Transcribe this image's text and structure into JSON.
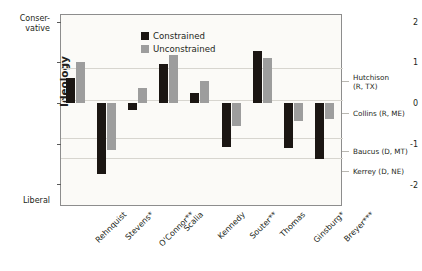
{
  "chart_data": {
    "type": "bar",
    "title": "",
    "xlabel": "",
    "ylabel": "Ideology",
    "ylim": [
      -2.45,
      2.25
    ],
    "yticks": [
      2,
      1,
      0,
      -1,
      -2
    ],
    "ytick_labels": [
      "2",
      "1",
      "0",
      "-1",
      "-2"
    ],
    "grid": true,
    "legend_position": "top-left-inside",
    "axis_top_label": "Conser-\nvative",
    "axis_bottom_label": "Liberal",
    "categories": [
      "Rehnquist",
      "Stevens*",
      "O'Connor**",
      "Scalia",
      "Kennedy",
      "Souter**",
      "Thomas",
      "Ginsburg*",
      "Breyer***"
    ],
    "series": [
      {
        "name": "Constrained",
        "color": "#1b1613",
        "values": [
          0.61,
          -1.75,
          -0.17,
          0.95,
          0.25,
          -1.08,
          1.27,
          -1.1,
          -1.37
        ]
      },
      {
        "name": "Unconstrained",
        "color": "#9d9d9d",
        "values": [
          1.0,
          -1.15,
          0.37,
          1.17,
          0.54,
          -0.56,
          1.1,
          -0.44,
          -0.39
        ]
      }
    ],
    "reference_lines": [
      {
        "label": "Hutchison\n(R, TX)",
        "value": 0.86
      },
      {
        "label": "Collins (R, ME)",
        "value": 0.07
      },
      {
        "label": "Baucus (D, MT)",
        "value": -0.86
      },
      {
        "label": "Kerrey (D, NE)",
        "value": -1.35
      }
    ]
  },
  "legend": {
    "items": [
      {
        "label": "Constrained"
      },
      {
        "label": "Unconstrained"
      }
    ]
  },
  "yticks": {
    "t0": "2",
    "t1": "1",
    "t2": "0",
    "t3": "-1",
    "t4": "-2"
  },
  "axis": {
    "ylabel": "Ideology",
    "conservative": "Conser-\nvative",
    "liberal": "Liberal"
  },
  "categories": {
    "c0": "Rehnquist",
    "c1": "Stevens*",
    "c2": "O'Connor**",
    "c3": "Scalia",
    "c4": "Kennedy",
    "c5": "Souter**",
    "c6": "Thomas",
    "c7": "Ginsburg*",
    "c8": "Breyer***"
  },
  "reference_labels": {
    "r0": "Hutchison\n(R, TX)",
    "r1": "Collins (R, ME)",
    "r2": "Baucus (D, MT)",
    "r3": "Kerrey (D, NE)"
  }
}
